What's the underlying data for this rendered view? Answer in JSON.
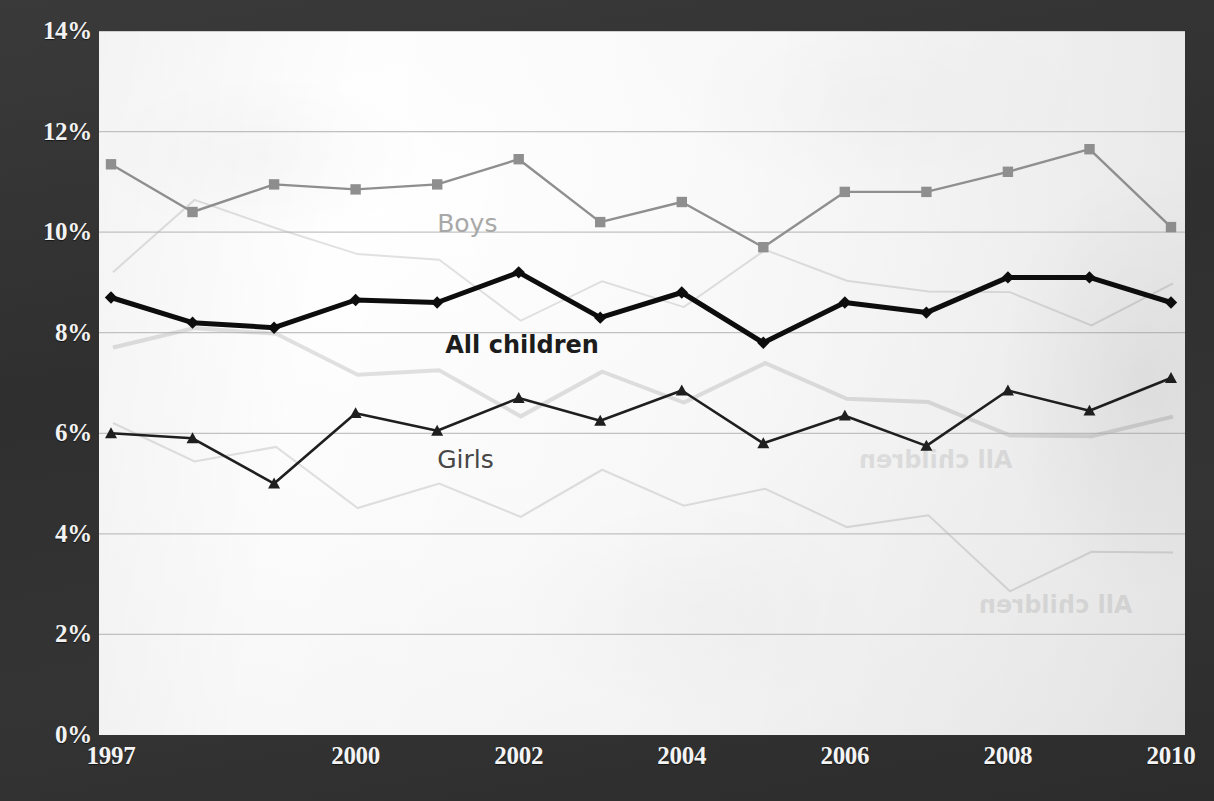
{
  "title": "",
  "chart_data": {
    "type": "line",
    "title": "",
    "subtitle": "",
    "xlabel": "",
    "ylabel": "",
    "x": [
      1997,
      1998,
      1999,
      2000,
      2001,
      2002,
      2003,
      2004,
      2005,
      2006,
      2007,
      2008,
      2009,
      2010
    ],
    "xtick_labels": [
      "1997",
      "2000",
      "2002",
      "2004",
      "2006",
      "2008",
      "2010"
    ],
    "xtick_values": [
      1997,
      2000,
      2002,
      2004,
      2006,
      2008,
      2010
    ],
    "ytick_labels": [
      "0%",
      "2%",
      "4%",
      "6%",
      "8%",
      "10%",
      "12%",
      "14%"
    ],
    "ytick_values": [
      0,
      2,
      4,
      6,
      8,
      10,
      12,
      14
    ],
    "ylim": [
      0,
      14
    ],
    "xlim": [
      1997,
      2010
    ],
    "grid": "horizontal",
    "legend": "inline-labels",
    "series": [
      {
        "name": "Boys",
        "color": "#8f8f8f",
        "marker": "square",
        "line_width": 2.4,
        "values": [
          11.35,
          10.4,
          10.95,
          10.85,
          10.95,
          11.45,
          10.2,
          10.6,
          9.7,
          10.8,
          10.8,
          11.2,
          11.65,
          10.1
        ]
      },
      {
        "name": "All children",
        "color": "#0d0d0d",
        "marker": "diamond",
        "line_width": 5.0,
        "values": [
          8.7,
          8.2,
          8.1,
          8.65,
          8.6,
          9.2,
          8.3,
          8.8,
          7.8,
          8.6,
          8.4,
          9.1,
          9.1,
          8.6
        ]
      },
      {
        "name": "Girls",
        "color": "#1f1f1f",
        "marker": "triangle",
        "line_width": 2.6,
        "values": [
          6.0,
          5.9,
          5.0,
          6.4,
          6.05,
          6.7,
          6.25,
          6.85,
          5.8,
          6.35,
          5.75,
          6.85,
          6.45,
          7.1
        ]
      }
    ],
    "inline_labels": [
      {
        "text": "Boys",
        "x": 2001.0,
        "y": 10.15,
        "series": "Boys"
      },
      {
        "text": "All children",
        "x": 2001.1,
        "y": 7.72,
        "series": "All children"
      },
      {
        "text": "Girls",
        "x": 2001.0,
        "y": 5.45,
        "series": "Girls"
      }
    ],
    "ghost_artifacts": [
      {
        "text": "All children",
        "x": 760,
        "y": 415
      },
      {
        "text": "All children",
        "x": 880,
        "y": 560
      }
    ]
  },
  "colors": {
    "background": "#323232",
    "plot_background": "#fbfbfb",
    "tick_text": "#f2f2f2",
    "gridline": "#b4b4b4",
    "boys": "#8f8f8f",
    "all_children": "#0d0d0d",
    "girls": "#1f1f1f"
  }
}
